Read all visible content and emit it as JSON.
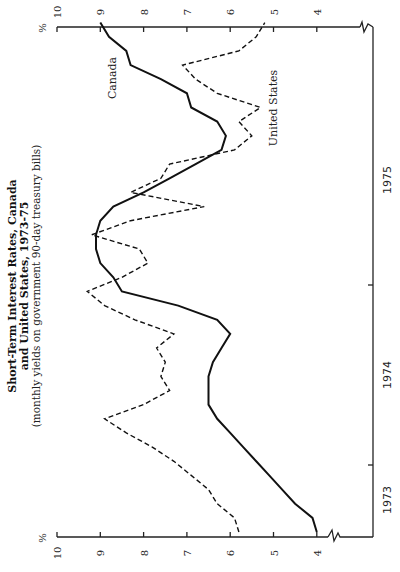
{
  "chart_data": {
    "type": "line",
    "orientation": "rotated-90-ccw",
    "title": "Short-Term Interest Rates, Canada and United States, 1973-75",
    "title_lines": [
      "Short-Term Interest Rates, Canada",
      "and United States, 1973-75"
    ],
    "subtitle": "(monthly yields on government 90-day treasury bills)",
    "xlabel": "",
    "ylabel": "%",
    "ylim": [
      4,
      10
    ],
    "y_ticks": [
      "10",
      "9",
      "8",
      "7",
      "6",
      "5",
      "4"
    ],
    "x_ticks": [
      "1973",
      "1974",
      "1975"
    ],
    "grid": false,
    "legend": "inline labels",
    "months": 36,
    "series": [
      {
        "name": "Canada",
        "style": "solid",
        "values": [
          4.0,
          4.1,
          4.5,
          4.8,
          5.1,
          5.4,
          5.7,
          6.0,
          6.3,
          6.5,
          6.5,
          6.5,
          6.4,
          6.2,
          6.0,
          6.3,
          7.2,
          8.5,
          8.7,
          9.0,
          9.1,
          9.1,
          9.0,
          8.7,
          8.0,
          7.4,
          6.8,
          6.2,
          6.1,
          6.3,
          6.9,
          7.0,
          7.6,
          8.3,
          8.4,
          8.8,
          9.0
        ]
      },
      {
        "name": "United States",
        "style": "dashed",
        "values": [
          5.8,
          5.9,
          6.3,
          6.5,
          6.9,
          7.3,
          7.8,
          8.4,
          8.9,
          8.0,
          7.4,
          7.6,
          7.5,
          7.7,
          7.3,
          8.2,
          8.9,
          9.3,
          8.5,
          7.9,
          8.1,
          9.2,
          8.3,
          6.6,
          8.3,
          7.6,
          7.4,
          5.9,
          5.5,
          5.8,
          5.3,
          6.3,
          6.8,
          7.1,
          5.8,
          5.4,
          5.2
        ]
      }
    ]
  },
  "axis": {
    "unit": "%",
    "ticks": [
      "10",
      "9",
      "8",
      "7",
      "6",
      "5",
      "4"
    ],
    "years": [
      "1973",
      "1974",
      "1975"
    ]
  },
  "labels": {
    "title_line1": "Short-Term Interest Rates, Canada",
    "title_line2": "and United States, 1973-75",
    "subtitle": "(monthly yields on government 90-day treasury bills)",
    "canada": "Canada",
    "us": "United States"
  }
}
